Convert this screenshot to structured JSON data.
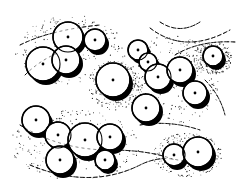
{
  "figure": {
    "type": "pen-and-ink site plan illustration",
    "width": 241,
    "height": 194,
    "colors": {
      "ink": "#000000",
      "paper": "#ffffff",
      "stipple": "#1a1a1a"
    }
  },
  "shadow_offset": {
    "dx": 3,
    "dy": 4
  },
  "trees": [
    {
      "id": "tl-1",
      "cx": 68,
      "cy": 37,
      "r": 15
    },
    {
      "id": "tl-2",
      "cx": 95,
      "cy": 40,
      "r": 11
    },
    {
      "id": "tl-3",
      "cx": 43,
      "cy": 64,
      "r": 17
    },
    {
      "id": "tl-4",
      "cx": 66,
      "cy": 60,
      "r": 14
    },
    {
      "id": "c-1",
      "cx": 113,
      "cy": 80,
      "r": 17
    },
    {
      "id": "r-1",
      "cx": 138,
      "cy": 50,
      "r": 10
    },
    {
      "id": "r-2",
      "cx": 148,
      "cy": 62,
      "r": 9
    },
    {
      "id": "r-3",
      "cx": 158,
      "cy": 77,
      "r": 13
    },
    {
      "id": "r-4",
      "cx": 180,
      "cy": 70,
      "r": 13
    },
    {
      "id": "r-5",
      "cx": 195,
      "cy": 93,
      "r": 12
    },
    {
      "id": "r-6",
      "cx": 146,
      "cy": 108,
      "r": 14
    },
    {
      "id": "iso-1",
      "cx": 213,
      "cy": 56,
      "r": 10
    },
    {
      "id": "bl-1",
      "cx": 36,
      "cy": 120,
      "r": 14
    },
    {
      "id": "bl-2",
      "cx": 58,
      "cy": 135,
      "r": 13
    },
    {
      "id": "bl-3",
      "cx": 60,
      "cy": 160,
      "r": 14
    },
    {
      "id": "bl-4",
      "cx": 85,
      "cy": 140,
      "r": 17
    },
    {
      "id": "bl-5",
      "cx": 110,
      "cy": 137,
      "r": 13
    },
    {
      "id": "bl-6",
      "cx": 105,
      "cy": 160,
      "r": 10
    },
    {
      "id": "br-1",
      "cx": 174,
      "cy": 155,
      "r": 11
    },
    {
      "id": "br-2",
      "cx": 198,
      "cy": 152,
      "r": 15
    }
  ],
  "contours": [
    "M 160 22 Q 180 35 200 22",
    "M 150 28 Q 185 55 230 30",
    "M 20 45 Q 50 30 100 25",
    "M 25 75 Q 40 60 60 52",
    "M 20 125 Q 60 150 110 150 Q 150 150 175 160",
    "M 30 165 Q 90 190 140 165 Q 170 150 200 170",
    "M 140 125 Q 170 120 200 130",
    "M 175 55 Q 200 40 235 42",
    "M 205 80 Q 220 95 225 115"
  ],
  "stipple_zones": [
    {
      "cx": 70,
      "cy": 50,
      "rx": 55,
      "ry": 35
    },
    {
      "cx": 170,
      "cy": 80,
      "rx": 55,
      "ry": 45
    },
    {
      "cx": 75,
      "cy": 145,
      "rx": 65,
      "ry": 35
    },
    {
      "cx": 188,
      "cy": 155,
      "rx": 35,
      "ry": 22
    },
    {
      "cx": 213,
      "cy": 58,
      "rx": 20,
      "ry": 16
    },
    {
      "cx": 115,
      "cy": 85,
      "rx": 28,
      "ry": 25
    }
  ],
  "stipple_density": 260
}
